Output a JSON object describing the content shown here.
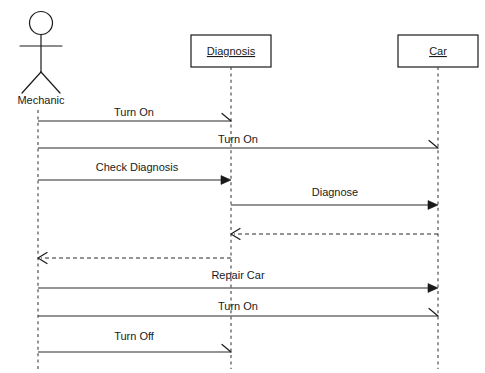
{
  "diagram": {
    "type": "uml-sequence-diagram",
    "background_color": "#ffffff",
    "line_color": "#1a1a1a",
    "participants": [
      {
        "id": "mechanic",
        "label": "Mechanic",
        "kind": "actor",
        "x": 38
      },
      {
        "id": "diagnosis",
        "label": "Diagnosis",
        "kind": "object",
        "x": 231
      },
      {
        "id": "car",
        "label": "Car",
        "kind": "object",
        "x": 438
      }
    ],
    "messages": [
      {
        "index": 1,
        "label": "Turn On",
        "from": "mechanic",
        "to": "diagnosis",
        "style": "solid",
        "arrowhead": "half",
        "y": 120
      },
      {
        "index": 2,
        "label": "Turn On",
        "from": "mechanic",
        "to": "car",
        "style": "solid",
        "arrowhead": "half",
        "y": 148
      },
      {
        "index": 3,
        "label": "Check Diagnosis",
        "from": "mechanic",
        "to": "diagnosis",
        "style": "solid",
        "arrowhead": "filled",
        "y": 180
      },
      {
        "index": 4,
        "label": "Diagnose",
        "from": "diagnosis",
        "to": "car",
        "style": "solid",
        "arrowhead": "filled",
        "y": 205
      },
      {
        "index": 5,
        "label": "",
        "from": "car",
        "to": "diagnosis",
        "style": "dashed",
        "arrowhead": "open",
        "y": 234
      },
      {
        "index": 6,
        "label": "",
        "from": "diagnosis",
        "to": "mechanic",
        "style": "dashed",
        "arrowhead": "open",
        "y": 258
      },
      {
        "index": 7,
        "label": "Repair Car",
        "from": "mechanic",
        "to": "car",
        "style": "solid",
        "arrowhead": "filled",
        "y": 288
      },
      {
        "index": 8,
        "label": "Turn On",
        "from": "mechanic",
        "to": "car",
        "style": "solid",
        "arrowhead": "half",
        "y": 316
      },
      {
        "index": 9,
        "label": "Turn Off",
        "from": "mechanic",
        "to": "diagnosis",
        "style": "solid",
        "arrowhead": "half",
        "y": 352
      }
    ]
  }
}
